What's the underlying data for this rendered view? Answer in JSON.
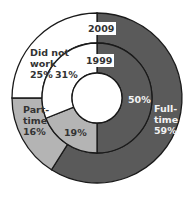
{
  "chart_data": {
    "type": "pie",
    "subtype": "nested-donut",
    "title": "",
    "rings": [
      {
        "name": "2009",
        "position": "outer",
        "categories": [
          "Full-time",
          "Part-time",
          "Did not work"
        ],
        "values": [
          59,
          16,
          25
        ]
      },
      {
        "name": "1999",
        "position": "inner",
        "categories": [
          "Full-time",
          "Part-time",
          "Did not work"
        ],
        "values": [
          50,
          19,
          31
        ]
      }
    ],
    "colors": {
      "Full-time": "#5a5a5a",
      "Part-time": "#b4b4b4",
      "Did not work": "#ffffff"
    },
    "start_angle": "top",
    "direction": "clockwise",
    "legend": "none",
    "labels": {
      "ring_2009": "2009",
      "ring_1999": "1999",
      "outer_full_time": [
        "Full-",
        "time",
        "59%"
      ],
      "outer_part_time": [
        "Part-",
        "time",
        "16%"
      ],
      "outer_did_not_work": [
        "Did not",
        "work",
        "25%"
      ],
      "inner_full_time": "50%",
      "inner_part_time": "19%",
      "inner_did_not_work": "31%"
    }
  }
}
